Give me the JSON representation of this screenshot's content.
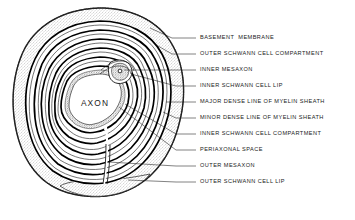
{
  "figure": {
    "type": "anatomical-cross-section-diagram",
    "background_color": "#ffffff",
    "ink_color": "#000000",
    "stipple_color": "#9a9a9a",
    "center_label": "AXON"
  },
  "labels": [
    {
      "id": "basement-membrane",
      "text": "BASEMENT  MEMBRANE"
    },
    {
      "id": "outer-schwann-cell-compartment",
      "text": "OUTER SCHWANN CELL COMPARTMENT"
    },
    {
      "id": "inner-mesaxon",
      "text": "INNER MESAXON"
    },
    {
      "id": "inner-schwann-cell-lip",
      "text": "INNER SCHWANN CELL LIP"
    },
    {
      "id": "major-dense-line",
      "text": "MAJOR DENSE LINE OF MYELIN SHEATH"
    },
    {
      "id": "minor-dense-line",
      "text": "MINOR DENSE LINE OF MYELIN SHEATH"
    },
    {
      "id": "inner-schwann-cell-compartment",
      "text": "INNER SCHWANN CELL COMPARTMENT"
    },
    {
      "id": "periaxonal-space",
      "text": "PERIAXONAL SPACE"
    },
    {
      "id": "outer-mesaxon",
      "text": "OUTER MESAXON"
    },
    {
      "id": "outer-schwann-cell-lip",
      "text": "OUTER SCHWANN CELL LIP"
    }
  ]
}
